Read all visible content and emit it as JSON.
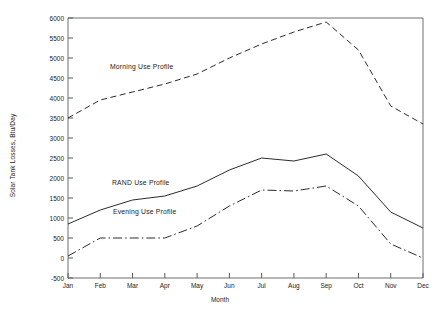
{
  "chart_data": {
    "type": "line",
    "title": "",
    "xlabel": "Month",
    "ylabel": "Solar Tank Losses, Btu/Day",
    "categories": [
      "Jan",
      "Feb",
      "Mar",
      "Apr",
      "May",
      "Jun",
      "Jul",
      "Aug",
      "Sep",
      "Oct",
      "Nov",
      "Dec"
    ],
    "ylim": [
      -500,
      6000
    ],
    "yticks": [
      -500,
      0,
      500,
      1000,
      1500,
      2000,
      2500,
      3000,
      3500,
      4000,
      4500,
      5000,
      5500,
      6000
    ],
    "ytick_labels": [
      "-500",
      "0",
      "500",
      "1000",
      "1500",
      "2000",
      "2500",
      "3000",
      "3500",
      "4000",
      "4500",
      "5000",
      "5500",
      "6000"
    ],
    "grid": false,
    "legend_position": "inline-annotations",
    "series": [
      {
        "name": "Morning Use Profile",
        "style": "dashed",
        "values": [
          3500,
          3950,
          4150,
          4350,
          4600,
          5000,
          5350,
          5650,
          5900,
          5200,
          3800,
          3350
        ]
      },
      {
        "name": "RAND Use Profile",
        "style": "solid",
        "values": [
          850,
          1200,
          1450,
          1550,
          1800,
          2200,
          2500,
          2425,
          2600,
          2050,
          1150,
          750
        ]
      },
      {
        "name": "Evening Use Profile",
        "style": "dash-dot",
        "values": [
          50,
          500,
          500,
          500,
          800,
          1300,
          1700,
          1675,
          1800,
          1300,
          350,
          0
        ]
      }
    ],
    "annotations": [
      {
        "text": "Morning Use Profile",
        "x_px": 110,
        "y_px": 63
      },
      {
        "text": "RAND Use Profile",
        "x_px": 112,
        "y_px": 179
      },
      {
        "text": "Evening Use Profile",
        "x_px": 113,
        "y_px": 208
      }
    ]
  }
}
